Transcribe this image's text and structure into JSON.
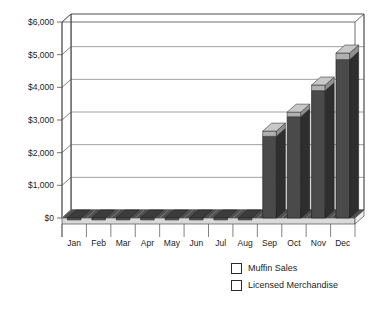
{
  "chart_data": {
    "type": "bar",
    "subtype": "stacked-3d-column",
    "title": "",
    "xlabel": "",
    "ylabel": "",
    "categories": [
      "Jan",
      "Feb",
      "Mar",
      "Apr",
      "May",
      "Jun",
      "Jul",
      "Aug",
      "Sep",
      "Oct",
      "Nov",
      "Dec"
    ],
    "series": [
      {
        "name": "Muffin Sales",
        "color": "#4a4a4a",
        "values": [
          0,
          0,
          0,
          0,
          0,
          0,
          0,
          0,
          2500,
          3100,
          3900,
          4850
        ]
      },
      {
        "name": "Licensed Merchandise",
        "color": "#b0b0b0",
        "values": [
          0,
          0,
          0,
          0,
          0,
          0,
          0,
          0,
          160,
          140,
          170,
          200
        ]
      }
    ],
    "totals": [
      0,
      0,
      0,
      0,
      0,
      0,
      0,
      0,
      2660,
      3240,
      4070,
      5050
    ],
    "ylim": [
      0,
      6000
    ],
    "ytick_values": [
      0,
      1000,
      2000,
      3000,
      4000,
      5000,
      6000
    ],
    "ytick_labels": [
      "$0",
      "$1,000",
      "$2,000",
      "$3,000",
      "$4,000",
      "$5,000",
      "$6,000"
    ],
    "grid": true,
    "legend_position": "bottom-right"
  },
  "legend": {
    "items": [
      {
        "label": "Muffin Sales",
        "color": "#4a4a4a"
      },
      {
        "label": "Licensed Merchandise",
        "color": "#b0b0b0"
      }
    ]
  },
  "colors": {
    "bar_primary": "#4a4a4a",
    "bar_primary_side": "#2e2e2e",
    "bar_primary_top": "#5e5e5e",
    "bar_secondary": "#b0b0b0",
    "bar_secondary_side": "#8f8f8f",
    "bar_secondary_top": "#c8c8c8",
    "axis_line": "#4d4d4d",
    "grid_line": "#777777",
    "wall": "#ffffff",
    "floor": "#4f4f4f",
    "text": "#1c1c1c"
  }
}
